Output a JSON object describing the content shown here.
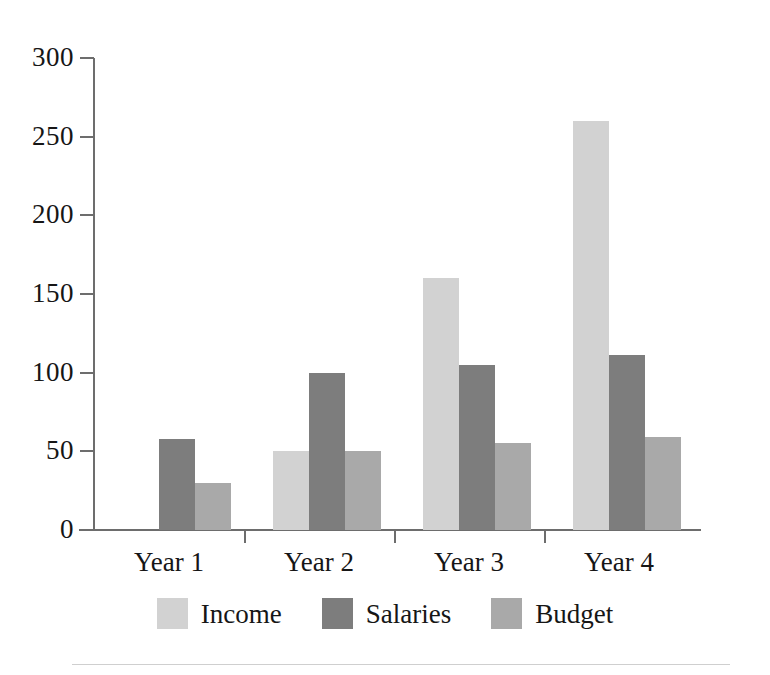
{
  "chart_data": {
    "type": "bar",
    "title": "",
    "subtitle": "",
    "xlabel": "",
    "ylabel": "",
    "categories": [
      "Year 1",
      "Year 2",
      "Year 3",
      "Year 4"
    ],
    "series": [
      {
        "name": "Income",
        "color": "#d2d2d2",
        "values": [
          0,
          50,
          160,
          260
        ]
      },
      {
        "name": "Salaries",
        "color": "#7d7d7d",
        "values": [
          58,
          100,
          105,
          111
        ]
      },
      {
        "name": "Budget",
        "color": "#a9a9a9",
        "values": [
          30,
          50,
          55,
          59
        ]
      }
    ],
    "ylim": [
      0,
      300
    ],
    "yticks": [
      0,
      50,
      100,
      150,
      200,
      250,
      300
    ],
    "ytick_labels": [
      "0",
      "50",
      "100",
      "150",
      "200",
      "250",
      "300"
    ],
    "grid": false,
    "legend_position": "bottom",
    "axis_color": "#6d6d6d",
    "text_color": "#161616",
    "background": "#ffffff"
  },
  "axis": {
    "y_labels": [
      "300",
      "250",
      "200",
      "150",
      "100",
      "50",
      "0"
    ],
    "x_labels": [
      "Year 1",
      "Year 2",
      "Year 3",
      "Year 4"
    ]
  },
  "legend": {
    "items": [
      {
        "label": "Income",
        "color": "#d2d2d2"
      },
      {
        "label": "Salaries",
        "color": "#7d7d7d"
      },
      {
        "label": "Budget",
        "color": "#a9a9a9"
      }
    ]
  }
}
